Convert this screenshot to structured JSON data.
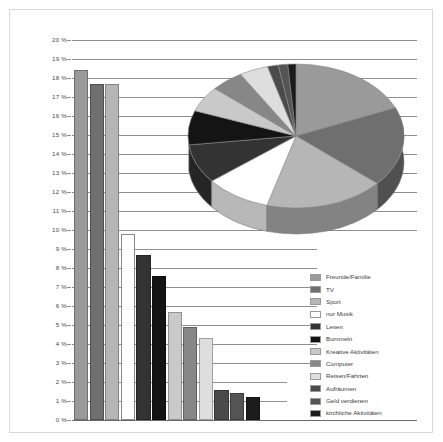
{
  "chart_data": {
    "type": "bar",
    "title": "",
    "xlabel": "",
    "ylabel": "",
    "ylim": [
      0,
      20
    ],
    "ytick_labels": [
      "20 %",
      "19 %",
      "18 %",
      "17 %",
      "16 %",
      "15 %",
      "14 %",
      "13 %",
      "12 %",
      "11 %",
      "10 %",
      "9 %",
      "8 %",
      "7 %",
      "6 %",
      "5 %",
      "4 %",
      "3 %",
      "2 %",
      "1 %",
      "0 %"
    ],
    "ytick_values": [
      20,
      19,
      18,
      17,
      16,
      15,
      14,
      13,
      12,
      11,
      10,
      9,
      8,
      7,
      6,
      5,
      4,
      3,
      2,
      1,
      0
    ],
    "grid": true,
    "legend_position": "bottom-right",
    "categories": [
      "Freunde/Familie",
      "TV",
      "Sport",
      "nur Musik",
      "Lesen",
      "Bummeln",
      "Kreative Aktivitäten",
      "Computer",
      "Reisen/Fahrten",
      "Aufräumen",
      "Geld verdienen",
      "kirchliche Aktivitäten"
    ],
    "values": [
      18.4,
      17.7,
      17.7,
      9.8,
      8.7,
      7.6,
      5.7,
      4.9,
      4.3,
      1.6,
      1.4,
      1.2
    ],
    "colors": [
      "#9a9a9a",
      "#6f6f6f",
      "#b6b6b6",
      "#ffffff",
      "#333333",
      "#141414",
      "#c9c9c9",
      "#878787",
      "#dedede",
      "#4a4a4a",
      "#555555",
      "#1c1c1c"
    ],
    "secondary_chart": {
      "type": "pie",
      "three_d": true,
      "categories": [
        "Freunde/Familie",
        "TV",
        "Sport",
        "nur Musik",
        "Lesen",
        "Bummeln",
        "Kreative Aktivitäten",
        "Computer",
        "Reisen/Fahrten",
        "Aufräumen",
        "Geld verdienen",
        "kirchliche Aktivitäten"
      ],
      "values": [
        18.4,
        17.7,
        17.7,
        9.8,
        8.7,
        7.6,
        5.7,
        4.9,
        4.3,
        1.6,
        1.4,
        1.2
      ]
    }
  },
  "legend": {
    "items": [
      {
        "label": "Freunde/Familie",
        "color": "#9a9a9a"
      },
      {
        "label": "TV",
        "color": "#6f6f6f"
      },
      {
        "label": "Sport",
        "color": "#b6b6b6"
      },
      {
        "label": "nur Musik",
        "color": "#ffffff"
      },
      {
        "label": "Lesen",
        "color": "#333333"
      },
      {
        "label": "Bummeln",
        "color": "#141414"
      },
      {
        "label": "Kreative Aktivitäten",
        "color": "#c9c9c9"
      },
      {
        "label": "Computer",
        "color": "#878787"
      },
      {
        "label": "Reisen/Fahrten",
        "color": "#dedede"
      },
      {
        "label": "Aufräumen",
        "color": "#4a4a4a"
      },
      {
        "label": "Geld verdienen",
        "color": "#555555"
      },
      {
        "label": "kirchliche Aktivitäten",
        "color": "#1c1c1c"
      }
    ]
  }
}
